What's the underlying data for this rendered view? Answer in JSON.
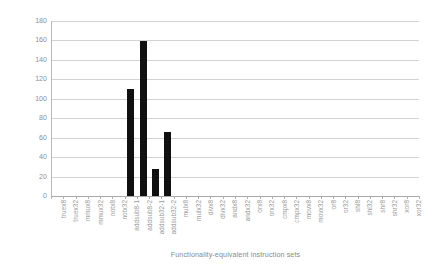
{
  "chart_data": {
    "type": "bar",
    "title": "",
    "xlabel": "Functionality-equivalent instruction sets",
    "ylabel": "Chi-square value",
    "ylim": [
      0,
      180
    ],
    "ytick_labels": [
      "180",
      "160",
      "140",
      "120",
      "100",
      "80",
      "60",
      "40",
      "20",
      "0"
    ],
    "ytick_values": [
      180,
      160,
      140,
      120,
      100,
      80,
      60,
      40,
      20,
      0
    ],
    "grid": true,
    "legend": false,
    "bar_color": "#101010",
    "grid_color": "#d2d2d2",
    "categories": [
      "truex8",
      "truex32",
      "mmux8",
      "mmux32",
      "notx8",
      "notx32",
      "addsub8-1",
      "addsub8-2",
      "addsub32-1",
      "addsub32-2",
      "mulx8",
      "mulx32",
      "divx8",
      "divx32",
      "andx8",
      "andx32",
      "orx8",
      "orx32",
      "cmpx8",
      "cmpx32",
      "movx8",
      "movx32",
      "or8",
      "or32",
      "shl8",
      "shl32",
      "shr8",
      "shr32",
      "xor8",
      "xor32"
    ],
    "values": [
      0,
      0,
      0,
      0,
      0,
      0,
      110,
      159,
      28,
      66,
      0,
      0,
      0,
      0,
      0,
      0,
      0,
      0,
      0,
      0,
      0,
      0,
      0,
      0,
      0,
      0,
      0,
      0,
      0,
      0
    ]
  }
}
